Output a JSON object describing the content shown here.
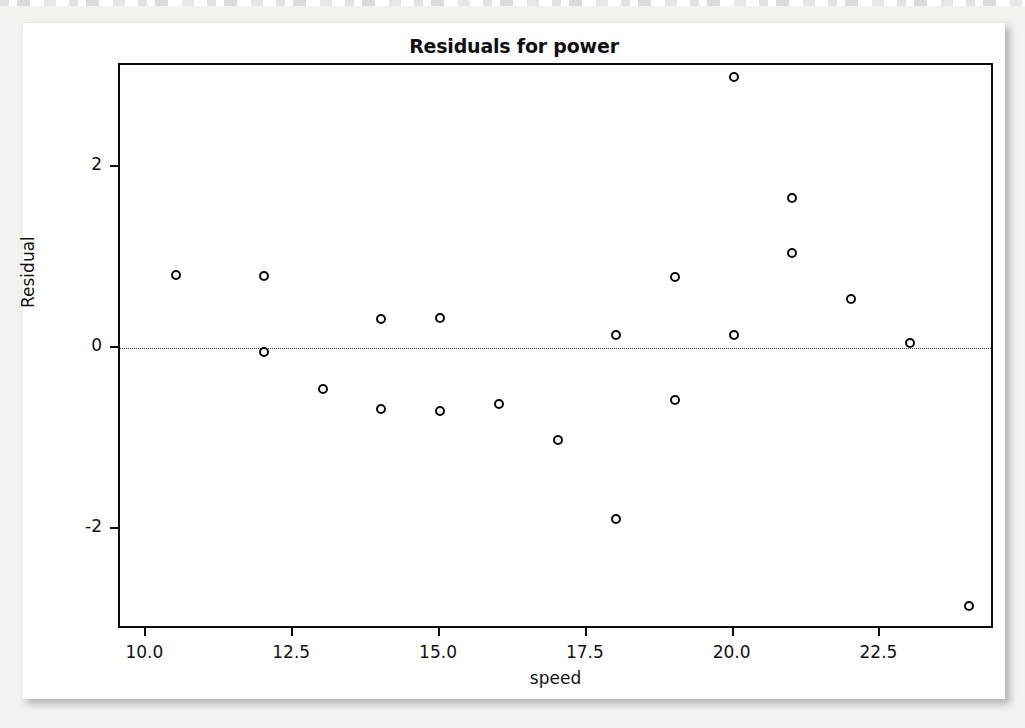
{
  "figure": {
    "title": "Residuals for power"
  },
  "chart_data": {
    "type": "scatter",
    "title": "Residuals for power",
    "xlabel": "speed",
    "ylabel": "Residual",
    "xlim": [
      9.55,
      24.45
    ],
    "ylim": [
      -3.12,
      3.13
    ],
    "xticks": [
      10.0,
      12.5,
      15.0,
      17.5,
      20.0,
      22.5
    ],
    "xticklabels": [
      "10.0",
      "12.5",
      "15.0",
      "17.5",
      "20.0",
      "22.5"
    ],
    "yticks": [
      2,
      0,
      -2
    ],
    "yticklabels": [
      "2",
      "0",
      "-2"
    ],
    "grid": false,
    "legend": null,
    "reference_line": {
      "y": 0,
      "style": "dotted"
    },
    "marker": "open-circle",
    "x": [
      10.5,
      12.0,
      12.0,
      13.0,
      14.0,
      14.0,
      15.0,
      15.0,
      16.0,
      17.0,
      18.0,
      18.0,
      19.0,
      19.0,
      20.0,
      20.0,
      21.0,
      21.0,
      22.0,
      23.0,
      24.0
    ],
    "y": [
      0.81,
      0.8,
      -0.04,
      -0.45,
      0.32,
      -0.67,
      0.33,
      -0.7,
      -0.62,
      -1.02,
      0.14,
      -1.89,
      0.78,
      -0.58,
      3.0,
      0.14,
      1.66,
      1.05,
      0.54,
      0.06,
      -2.85
    ],
    "points": [
      {
        "x": 10.5,
        "y": 0.81
      },
      {
        "x": 12.0,
        "y": 0.8
      },
      {
        "x": 12.0,
        "y": -0.04
      },
      {
        "x": 13.0,
        "y": -0.45
      },
      {
        "x": 14.0,
        "y": 0.32
      },
      {
        "x": 14.0,
        "y": -0.67
      },
      {
        "x": 15.0,
        "y": 0.33
      },
      {
        "x": 15.0,
        "y": -0.7
      },
      {
        "x": 16.0,
        "y": -0.62
      },
      {
        "x": 17.0,
        "y": -1.02
      },
      {
        "x": 18.0,
        "y": 0.14
      },
      {
        "x": 18.0,
        "y": -1.89
      },
      {
        "x": 19.0,
        "y": 0.78
      },
      {
        "x": 19.0,
        "y": -0.58
      },
      {
        "x": 20.0,
        "y": 3.0
      },
      {
        "x": 20.0,
        "y": 0.14
      },
      {
        "x": 21.0,
        "y": 1.66
      },
      {
        "x": 21.0,
        "y": 1.05
      },
      {
        "x": 22.0,
        "y": 0.54
      },
      {
        "x": 23.0,
        "y": 0.06
      },
      {
        "x": 24.0,
        "y": -2.85
      }
    ]
  },
  "colors": {
    "marker_stroke": "#0a0a0a",
    "frame": "#0d0d0d",
    "text": "#111111",
    "card_background": "#ffffff",
    "page_background": "#f2f2f0"
  }
}
